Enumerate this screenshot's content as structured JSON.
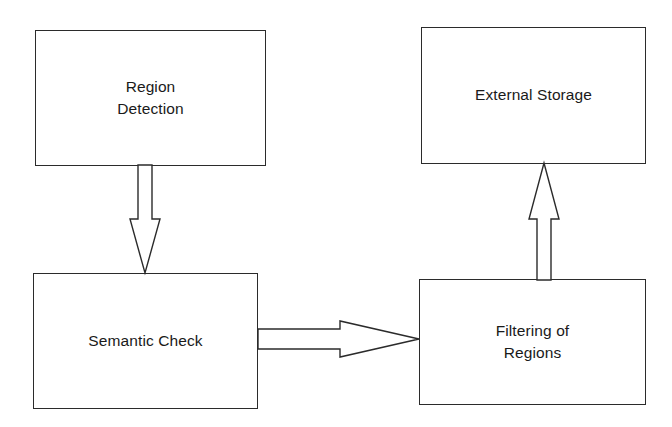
{
  "diagram": {
    "background_color": "#ffffff",
    "stroke_color": "#2b2b2b",
    "text_color": "#1a1a1a",
    "nodes": [
      {
        "id": "region-detection",
        "label": "Region\nDetection",
        "shape": "rectangle"
      },
      {
        "id": "external-storage",
        "label": "External Storage",
        "shape": "rectangle"
      },
      {
        "id": "semantic-check",
        "label": "Semantic Check",
        "shape": "rectangle"
      },
      {
        "id": "filtering-regions",
        "label": "Filtering of\nRegions",
        "shape": "rectangle"
      }
    ],
    "edges": [
      {
        "id": "detection-to-semantic",
        "from": "region-detection",
        "to": "semantic-check",
        "direction": "down",
        "style": "hollow-block-arrow",
        "label": ""
      },
      {
        "id": "semantic-to-filtering",
        "from": "semantic-check",
        "to": "filtering-regions",
        "direction": "right",
        "style": "hollow-block-arrow",
        "label": ""
      },
      {
        "id": "filtering-to-storage",
        "from": "filtering-regions",
        "to": "external-storage",
        "direction": "up",
        "style": "hollow-block-arrow",
        "label": ""
      }
    ]
  }
}
